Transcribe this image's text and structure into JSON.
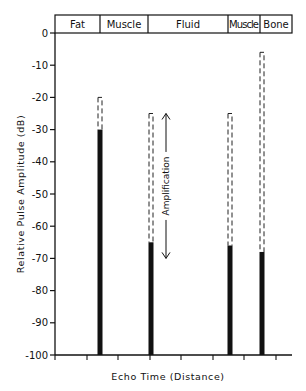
{
  "chart_data": {
    "type": "bar",
    "title": "",
    "xlabel": "Echo Time (Distance)",
    "ylabel": "Relative Pulse Amplitude (dB)",
    "ylim": [
      -100,
      0
    ],
    "yticks": [
      0,
      -10,
      -20,
      -30,
      -40,
      -50,
      -60,
      -70,
      -80,
      -90,
      -100
    ],
    "ytick_labels": [
      "0",
      "-10",
      "-20",
      "-30",
      "-40",
      "-50",
      "-60",
      "-70",
      "-80",
      "-90",
      "-100"
    ],
    "grid": false,
    "tissue_regions": [
      "Fat",
      "Muscle",
      "Fluid",
      "Muscle",
      "Bone"
    ],
    "categories": [
      "Fat/Muscle interface",
      "Muscle/Fluid interface",
      "Fluid/Muscle interface",
      "Muscle/Bone interface"
    ],
    "series": [
      {
        "name": "Received echo (solid)",
        "style": "solid",
        "values": [
          -30,
          -65,
          -66,
          -68
        ]
      },
      {
        "name": "Original echo amplitude (dashed)",
        "style": "dashed",
        "values": [
          -20,
          -25,
          -25,
          -6
        ]
      }
    ],
    "annotations": [
      {
        "text": "Amplification",
        "type": "double-arrow",
        "from": -25,
        "to": -70
      }
    ]
  },
  "header": {
    "regions": [
      {
        "label": "Fat"
      },
      {
        "label": "Muscle"
      },
      {
        "label": "Fluid"
      },
      {
        "label": "Muscle"
      },
      {
        "label": "Bone"
      }
    ]
  }
}
